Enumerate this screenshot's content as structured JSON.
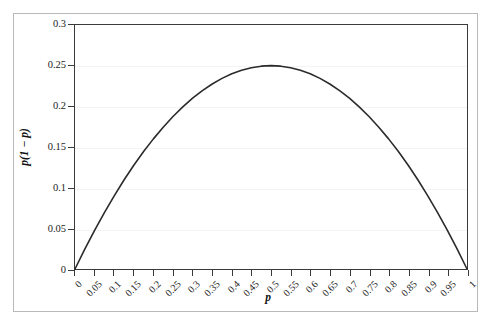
{
  "chart_data": {
    "type": "line",
    "title": "",
    "xlabel": "p",
    "ylabel": "p(1 − p)",
    "xlim": [
      0,
      1
    ],
    "ylim": [
      0,
      0.3
    ],
    "grid": true,
    "legend": "none",
    "x_ticks": [
      "0",
      "0.05",
      "0.1",
      "0.15",
      "0.2",
      "0.25",
      "0.3",
      "0.35",
      "0.4",
      "0.45",
      "0.5",
      "0.55",
      "0.6",
      "0.65",
      "0.7",
      "0.75",
      "0.8",
      "0.85",
      "0.9",
      "0.95",
      "1"
    ],
    "x_tick_values": [
      0,
      0.05,
      0.1,
      0.15,
      0.2,
      0.25,
      0.3,
      0.35,
      0.4,
      0.45,
      0.5,
      0.55,
      0.6,
      0.65,
      0.7,
      0.75,
      0.8,
      0.85,
      0.9,
      0.95,
      1
    ],
    "y_ticks": [
      "0",
      "0.05",
      "0.1",
      "0.15",
      "0.2",
      "0.25",
      "0.3"
    ],
    "y_tick_values": [
      0,
      0.05,
      0.1,
      0.15,
      0.2,
      0.25,
      0.3
    ],
    "series": [
      {
        "name": "p(1 − p)",
        "color": "#2b2b2b",
        "x": [
          0,
          0.025,
          0.05,
          0.075,
          0.1,
          0.125,
          0.15,
          0.175,
          0.2,
          0.225,
          0.25,
          0.275,
          0.3,
          0.325,
          0.35,
          0.375,
          0.4,
          0.425,
          0.45,
          0.475,
          0.5,
          0.525,
          0.55,
          0.575,
          0.6,
          0.625,
          0.65,
          0.675,
          0.7,
          0.725,
          0.75,
          0.775,
          0.8,
          0.825,
          0.85,
          0.875,
          0.9,
          0.925,
          0.95,
          0.975,
          1
        ],
        "y": [
          0,
          0.024375,
          0.0475,
          0.069375,
          0.09,
          0.109375,
          0.1275,
          0.144375,
          0.16,
          0.174375,
          0.1875,
          0.199375,
          0.21,
          0.219375,
          0.2275,
          0.234375,
          0.24,
          0.244375,
          0.2475,
          0.249375,
          0.25,
          0.249375,
          0.2475,
          0.244375,
          0.24,
          0.234375,
          0.2275,
          0.219375,
          0.21,
          0.199375,
          0.1875,
          0.174375,
          0.16,
          0.144375,
          0.1275,
          0.109375,
          0.09,
          0.069375,
          0.0475,
          0.024375,
          0
        ]
      }
    ],
    "annotations": [
      {
        "label": "maximum",
        "x": 0.5,
        "y": 0.25
      }
    ],
    "colors": {
      "curve": "#2b2b2b",
      "axis": "#3a3a3a",
      "gridline": "#f4f4f4",
      "outer_frame": "#b9b9b9",
      "background": "#ffffff",
      "tick_text": "#1c1c1c"
    }
  }
}
